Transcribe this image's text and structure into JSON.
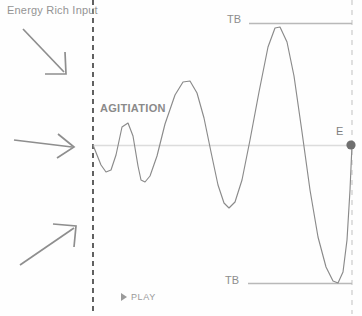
{
  "diagram": {
    "title_label": "Energy Rich Input",
    "agitiation_label": "AGITIATION",
    "threshold_top_label": "TB",
    "threshold_bottom_label": "TB",
    "end_point_label": "E",
    "play_label": "PLAY",
    "play_icon": "play-triangle-icon",
    "arrows": [
      {
        "name": "arrow-energy-input-1",
        "direction": "down-right"
      },
      {
        "name": "arrow-energy-input-2",
        "direction": "right"
      },
      {
        "name": "arrow-energy-input-3",
        "direction": "up-right"
      }
    ],
    "colors": {
      "background": "#fefefe",
      "wave_stroke": "#8a8a8a",
      "baseline": "#d8d8d8",
      "threshold_line": "#b8b8b8",
      "start_boundary_dash": "#3a3a3a",
      "end_boundary_dash": "#cfcfcf",
      "arrow": "#8e8e8e",
      "text": "#8d8d8d",
      "end_point_dot": "#707070"
    }
  },
  "chart_data": {
    "type": "line",
    "title": "AGITIATION",
    "xlabel": "",
    "ylabel": "",
    "grid": false,
    "legend": null,
    "annotations": [
      {
        "text": "Energy Rich Input",
        "x": 8,
        "y": 10
      },
      {
        "text": "AGITIATION",
        "x": 100,
        "y": 110
      },
      {
        "text": "TB",
        "x": 232,
        "y": 20
      },
      {
        "text": "TB",
        "x": 230,
        "y": 281
      },
      {
        "text": "E",
        "x": 340,
        "y": 132
      }
    ],
    "axis_ranges": {
      "x": [
        93,
        352
      ],
      "y": [
        23,
        283
      ]
    },
    "baseline_y": 145,
    "threshold_top_y": 23,
    "threshold_bottom_y": 283,
    "threshold_line_x_range": [
      249,
      352
    ],
    "start_boundary_x": 93,
    "end_boundary_x": 352,
    "end_point": {
      "x": 351,
      "y": 145,
      "label": "E"
    },
    "series": [
      {
        "name": "agitiation-wave",
        "description": "Oscillation of exponentially growing amplitude from start boundary to end point E",
        "points": [
          [
            93,
            145
          ],
          [
            97,
            155
          ],
          [
            101,
            165
          ],
          [
            106,
            172
          ],
          [
            111,
            170
          ],
          [
            116,
            155
          ],
          [
            122,
            127
          ],
          [
            128,
            123
          ],
          [
            133,
            136
          ],
          [
            138,
            166
          ],
          [
            141,
            180
          ],
          [
            145,
            182
          ],
          [
            150,
            176
          ],
          [
            157,
            156
          ],
          [
            165,
            124
          ],
          [
            175,
            95
          ],
          [
            183,
            82
          ],
          [
            190,
            81
          ],
          [
            197,
            93
          ],
          [
            204,
            118
          ],
          [
            211,
            152
          ],
          [
            218,
            185
          ],
          [
            224,
            203
          ],
          [
            229,
            208
          ],
          [
            235,
            202
          ],
          [
            242,
            180
          ],
          [
            250,
            140
          ],
          [
            259,
            92
          ],
          [
            268,
            47
          ],
          [
            275,
            28
          ],
          [
            280,
            27
          ],
          [
            287,
            42
          ],
          [
            294,
            76
          ],
          [
            302,
            132
          ],
          [
            310,
            190
          ],
          [
            318,
            237
          ],
          [
            326,
            267
          ],
          [
            333,
            281
          ],
          [
            338,
            283
          ],
          [
            343,
            272
          ],
          [
            347,
            240
          ],
          [
            350,
            190
          ],
          [
            352,
            145
          ]
        ]
      }
    ]
  }
}
